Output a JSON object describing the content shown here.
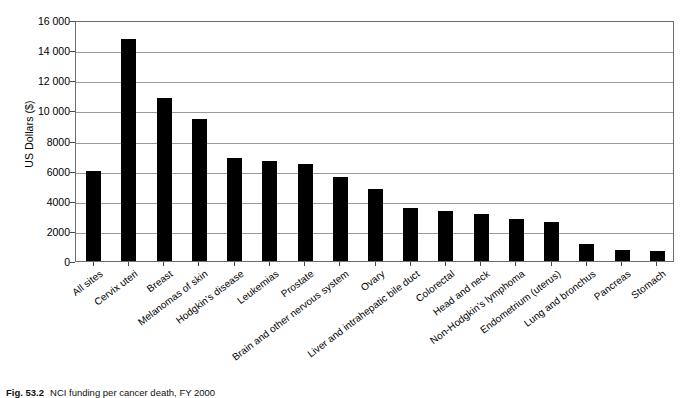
{
  "chart_data": {
    "type": "bar",
    "title": "",
    "xlabel": "",
    "ylabel": "US Dollars ($)",
    "ylim": [
      0,
      16000
    ],
    "ytick_step": 2000,
    "grid": true,
    "legend": "none",
    "bar_color": "#000000",
    "categories": [
      "All sites",
      "Cervix uteri",
      "Breast",
      "Melanomas of skin",
      "Hodgkin's disease",
      "Leukemias",
      "Prostate",
      "Brain and other nervous system",
      "Ovary",
      "Liver and intrahepatic bile duct",
      "Colorectal",
      "Head and neck",
      "Non-Hodgkin's lymphoma",
      "Endometrium (uterus)",
      "Lung and bronchus",
      "Pancreas",
      "Stomach"
    ],
    "values": [
      6000,
      14750,
      10850,
      9400,
      6850,
      6650,
      6450,
      5550,
      4750,
      3500,
      3300,
      3100,
      2800,
      2600,
      1100,
      700,
      650
    ],
    "ytick_labels": [
      "0",
      "2000",
      "4000",
      "6000",
      "8000",
      "10 000",
      "12 000",
      "14 000",
      "16 000"
    ],
    "ytick_values": [
      0,
      2000,
      4000,
      6000,
      8000,
      10000,
      12000,
      14000,
      16000
    ]
  },
  "caption": {
    "label": "Fig. 53.2",
    "text": "NCI funding per cancer death, FY 2000"
  }
}
